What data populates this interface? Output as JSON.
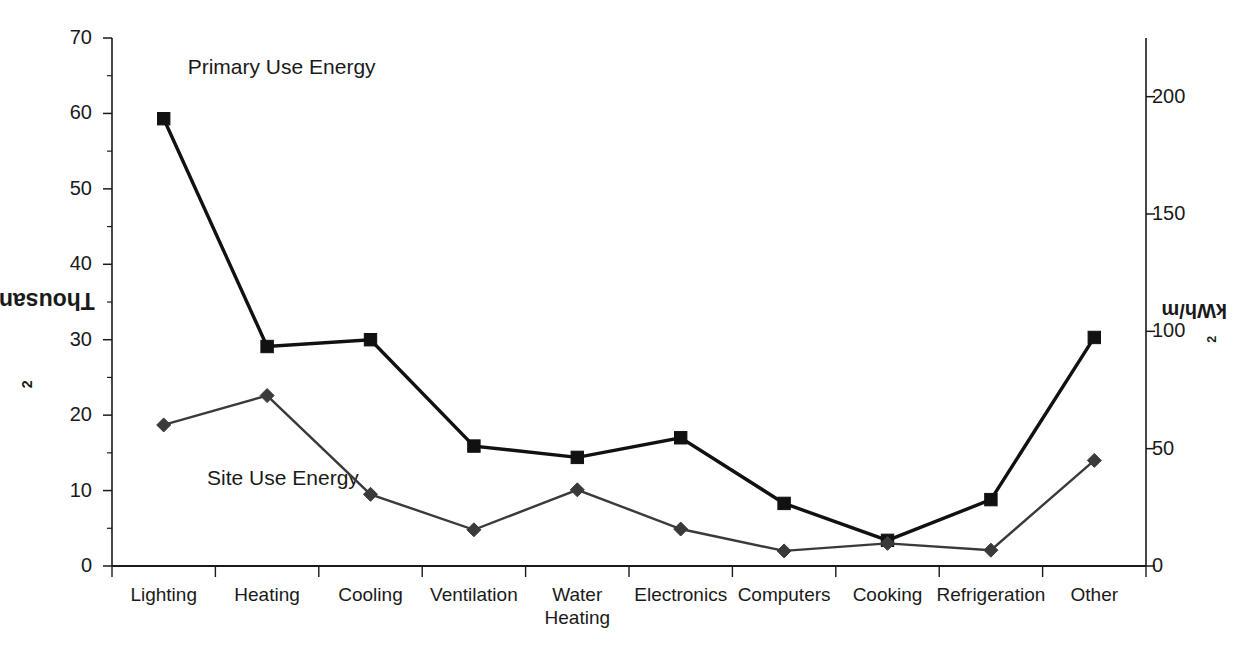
{
  "chart_data": {
    "type": "line",
    "title": "",
    "categories": [
      "Lighting",
      "Heating",
      "Cooling",
      "Ventilation",
      "Water Heating",
      "Electronics",
      "Computers",
      "Cooking",
      "Refrigeration",
      "Other"
    ],
    "series": [
      {
        "name": "Primary Use Energy",
        "marker": "square",
        "color": "#111111",
        "values": [
          59.3,
          29.1,
          30.0,
          15.9,
          14.4,
          17.0,
          8.3,
          3.4,
          8.8,
          30.3
        ]
      },
      {
        "name": "Site Use Energy",
        "marker": "diamond",
        "color": "#3a3a3a",
        "values": [
          18.7,
          22.6,
          9.5,
          4.8,
          10.1,
          4.9,
          2.0,
          3.0,
          2.1,
          14.0
        ]
      }
    ],
    "ylabel_left": "Thousand Btu/ft²",
    "ylabel_left_plain": "Thousand Btu/ft2",
    "ylabel_left_base": "Thousand Btu/ft",
    "ylabel_left_exp": "2",
    "ylabel_right_base": "kWh/m",
    "ylabel_right_exp": "2",
    "ylabel_right_plain": "kWh/m2",
    "xlabel": "",
    "ylim_left": [
      0,
      70
    ],
    "ylim_right": [
      0,
      225
    ],
    "yticks_left": [
      "0",
      "10",
      "20",
      "30",
      "40",
      "50",
      "60",
      "70"
    ],
    "yticks_left_values": [
      0,
      10,
      20,
      30,
      40,
      50,
      60,
      70
    ],
    "yticks_right": [
      "0",
      "50",
      "100",
      "150",
      "200"
    ],
    "yticks_right_values": [
      0,
      50,
      100,
      150,
      200
    ],
    "grid": false,
    "legend_position": "inline-annotations",
    "annotations": [
      {
        "text": "Primary Use Energy",
        "x_category": "Lighting",
        "y_value": 66
      },
      {
        "text": "Site Use Energy",
        "x_category": "Heating",
        "y_value": 11.5
      }
    ]
  },
  "axis": {
    "left_title_base": "Thousand Btu/ft",
    "left_title_exp": "2",
    "right_title_base": "kWh/m",
    "right_title_exp": "2"
  },
  "ticks": {
    "left": [
      {
        "label": "70"
      },
      {
        "label": "60"
      },
      {
        "label": "50"
      },
      {
        "label": "40"
      },
      {
        "label": "30"
      },
      {
        "label": "20"
      },
      {
        "label": "10"
      },
      {
        "label": "0"
      }
    ],
    "right": [
      {
        "label": "200"
      },
      {
        "label": "150"
      },
      {
        "label": "100"
      },
      {
        "label": "50"
      },
      {
        "label": "0"
      }
    ]
  },
  "categories": [
    {
      "line1": "Lighting",
      "line2": ""
    },
    {
      "line1": "Heating",
      "line2": ""
    },
    {
      "line1": "Cooling",
      "line2": ""
    },
    {
      "line1": "Ventilation",
      "line2": ""
    },
    {
      "line1": "Water",
      "line2": "Heating"
    },
    {
      "line1": "Electronics",
      "line2": ""
    },
    {
      "line1": "Computers",
      "line2": ""
    },
    {
      "line1": "Cooking",
      "line2": ""
    },
    {
      "line1": "Refrigeration",
      "line2": ""
    },
    {
      "line1": "Other",
      "line2": ""
    }
  ],
  "annotations": {
    "primary": "Primary Use Energy",
    "site": "Site Use Energy"
  }
}
